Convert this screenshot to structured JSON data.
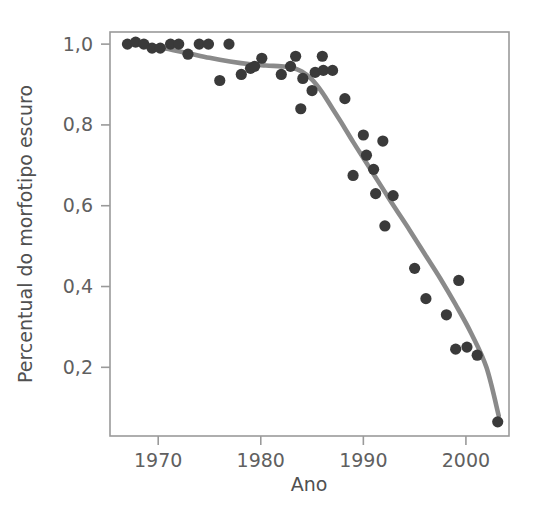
{
  "figure": {
    "background_color": "#ffffff",
    "point_color": "#3a3a3a",
    "curve_color": "#8a8a8a",
    "axis_color": "#9a9a9a",
    "text_color": "#606060"
  },
  "chart_data": {
    "type": "scatter",
    "title": "",
    "subtitle": "",
    "xlabel": "Ano",
    "ylabel": "Percentual do morfotipo escuro",
    "xlim": [
      1965.3,
      2004.2
    ],
    "ylim": [
      0.03,
      1.03
    ],
    "grid": false,
    "legend": null,
    "legend_position": "none",
    "xticks": [
      1970,
      1980,
      1990,
      2000
    ],
    "xtick_labels": [
      "1970",
      "1980",
      "1990",
      "2000"
    ],
    "yticks": [
      0.2,
      0.4,
      0.6,
      0.8,
      1.0
    ],
    "ytick_labels": [
      "0,2",
      "0,4",
      "0,6",
      "0,8",
      "1,0"
    ],
    "decimal_separator": ",",
    "series": [
      {
        "name": "Percentual do morfotipo escuro",
        "marker": "circle",
        "color": "#3a3a3a",
        "x": [
          1967.0,
          1967.8,
          1968.6,
          1969.4,
          1970.2,
          1971.2,
          1972.0,
          1972.9,
          1974.0,
          1974.9,
          1976.0,
          1976.9,
          1978.1,
          1979.0,
          1979.4,
          1980.1,
          1982.0,
          1982.9,
          1983.4,
          1983.9,
          1984.1,
          1985.0,
          1985.3,
          1986.0,
          1986.1,
          1987.0,
          1988.2,
          1989.0,
          1990.0,
          1990.3,
          1991.0,
          1991.2,
          1991.9,
          1992.1,
          1992.9,
          1995.0,
          1996.1,
          1998.1,
          1999.0,
          1999.3,
          2000.1,
          2001.1,
          2003.1
        ],
        "y": [
          1.0,
          1.005,
          1.0,
          0.99,
          0.99,
          1.0,
          1.0,
          0.975,
          1.0,
          1.0,
          0.91,
          1.0,
          0.925,
          0.94,
          0.945,
          0.965,
          0.925,
          0.945,
          0.97,
          0.84,
          0.915,
          0.885,
          0.93,
          0.97,
          0.935,
          0.935,
          0.865,
          0.675,
          0.775,
          0.725,
          0.69,
          0.63,
          0.76,
          0.55,
          0.625,
          0.445,
          0.37,
          0.33,
          0.245,
          0.415,
          0.25,
          0.23,
          0.065
        ]
      }
    ],
    "trend_curve": {
      "name": "smoothed trend",
      "color": "#8a8a8a",
      "x": [
        1967.0,
        1968.5,
        1970.0,
        1971.5,
        1973.0,
        1975.0,
        1977.0,
        1979.0,
        1980.5,
        1982.0,
        1983.0,
        1984.0,
        1985.0,
        1986.0,
        1987.0,
        1988.0,
        1989.0,
        1990.0,
        1991.0,
        1992.0,
        1993.0,
        1994.5,
        1996.0,
        1997.5,
        1999.0,
        2000.5,
        2002.0,
        2003.2
      ],
      "y": [
        1.0,
        0.998,
        0.993,
        0.985,
        0.977,
        0.966,
        0.957,
        0.95,
        0.947,
        0.945,
        0.942,
        0.932,
        0.912,
        0.88,
        0.84,
        0.8,
        0.758,
        0.718,
        0.678,
        0.638,
        0.598,
        0.54,
        0.48,
        0.42,
        0.355,
        0.285,
        0.2,
        0.08
      ]
    }
  }
}
